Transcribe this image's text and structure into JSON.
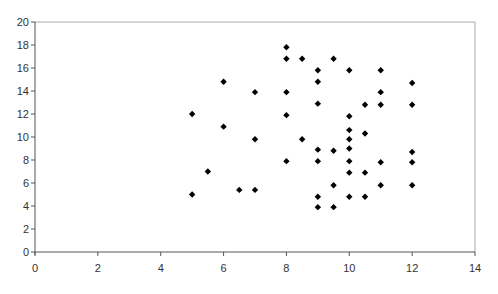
{
  "chart_data": {
    "type": "scatter",
    "title": "",
    "xlabel": "",
    "ylabel": "",
    "xlim": [
      0,
      14
    ],
    "ylim": [
      0,
      20
    ],
    "x_ticks": [
      0,
      2,
      4,
      6,
      8,
      10,
      12,
      14
    ],
    "y_ticks": [
      0,
      2,
      4,
      6,
      8,
      10,
      12,
      14,
      16,
      18,
      20
    ],
    "grid": false,
    "legend": null,
    "marker": "diamond",
    "marker_color": "#000000",
    "frame": "box",
    "series": [
      {
        "name": "",
        "points": [
          {
            "x": 5,
            "y": 12
          },
          {
            "x": 5,
            "y": 5
          },
          {
            "x": 5.5,
            "y": 7
          },
          {
            "x": 6,
            "y": 14.8
          },
          {
            "x": 6,
            "y": 10.9
          },
          {
            "x": 6.5,
            "y": 5.4
          },
          {
            "x": 7,
            "y": 13.9
          },
          {
            "x": 7,
            "y": 9.8
          },
          {
            "x": 7,
            "y": 5.4
          },
          {
            "x": 8,
            "y": 17.8
          },
          {
            "x": 8,
            "y": 16.8
          },
          {
            "x": 8,
            "y": 13.9
          },
          {
            "x": 8,
            "y": 11.9
          },
          {
            "x": 8,
            "y": 7.9
          },
          {
            "x": 8.5,
            "y": 16.8
          },
          {
            "x": 8.5,
            "y": 9.8
          },
          {
            "x": 9,
            "y": 15.8
          },
          {
            "x": 9,
            "y": 14.8
          },
          {
            "x": 9,
            "y": 12.9
          },
          {
            "x": 9,
            "y": 8.9
          },
          {
            "x": 9,
            "y": 7.9
          },
          {
            "x": 9,
            "y": 4.8
          },
          {
            "x": 9,
            "y": 3.9
          },
          {
            "x": 9.5,
            "y": 16.8
          },
          {
            "x": 9.5,
            "y": 8.8
          },
          {
            "x": 9.5,
            "y": 5.8
          },
          {
            "x": 9.5,
            "y": 3.9
          },
          {
            "x": 10,
            "y": 15.8
          },
          {
            "x": 10,
            "y": 11.8
          },
          {
            "x": 10,
            "y": 10.6
          },
          {
            "x": 10,
            "y": 9.8
          },
          {
            "x": 10,
            "y": 9.0
          },
          {
            "x": 10,
            "y": 7.9
          },
          {
            "x": 10,
            "y": 6.9
          },
          {
            "x": 10,
            "y": 4.8
          },
          {
            "x": 10.5,
            "y": 12.8
          },
          {
            "x": 10.5,
            "y": 10.3
          },
          {
            "x": 10.5,
            "y": 6.9
          },
          {
            "x": 10.5,
            "y": 4.8
          },
          {
            "x": 11,
            "y": 15.8
          },
          {
            "x": 11,
            "y": 13.9
          },
          {
            "x": 11,
            "y": 12.8
          },
          {
            "x": 11,
            "y": 7.8
          },
          {
            "x": 11,
            "y": 5.8
          },
          {
            "x": 12,
            "y": 14.7
          },
          {
            "x": 12,
            "y": 12.8
          },
          {
            "x": 12,
            "y": 8.7
          },
          {
            "x": 12,
            "y": 7.8
          },
          {
            "x": 12,
            "y": 5.8
          }
        ]
      }
    ]
  },
  "layout": {
    "plot_left": 35,
    "plot_right": 475,
    "plot_top": 22,
    "plot_bottom": 252,
    "axis_color": "#555555",
    "frame_color": "#aaaaaa",
    "marker_size": 3.2
  }
}
